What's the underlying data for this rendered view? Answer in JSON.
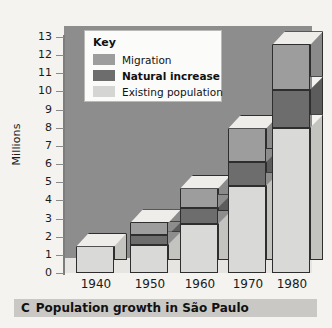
{
  "figure": {
    "caption_letter": "C",
    "caption_text": "Population growth in São Paulo"
  },
  "legend": {
    "title": "Key",
    "items": [
      {
        "label": "Migration",
        "color": "#9d9d9d",
        "bold": false
      },
      {
        "label": "Natural increase",
        "color": "#6d6d6d",
        "bold": true
      },
      {
        "label": "Existing population",
        "color": "#d5d5d3",
        "bold": false
      }
    ]
  },
  "chart_data": {
    "type": "bar",
    "title": "Population growth in São Paulo",
    "xlabel": "",
    "ylabel": "Millions",
    "ylim": [
      0,
      13
    ],
    "yticks": [
      13,
      12,
      11,
      10,
      9,
      8,
      7,
      6,
      5,
      4,
      3,
      2,
      1,
      0
    ],
    "grid": false,
    "stacked": true,
    "legend_position": "inside-top-left",
    "categories": [
      "1940",
      "1950",
      "1960",
      "1970",
      "1980"
    ],
    "series": [
      {
        "name": "Existing population",
        "color": "#d5d5d3",
        "values": [
          1.5,
          1.55,
          2.7,
          4.8,
          8.0
        ]
      },
      {
        "name": "Natural increase",
        "color": "#6d6d6d",
        "values": [
          0,
          0.55,
          0.9,
          1.3,
          2.1
        ]
      },
      {
        "name": "Migration",
        "color": "#9d9d9d",
        "values": [
          0,
          0.7,
          1.1,
          1.9,
          2.5
        ]
      }
    ],
    "totals": [
      1.5,
      2.8,
      4.7,
      8.0,
      12.6
    ]
  },
  "colors": {
    "plot_background": "#8d8d8d",
    "page_background": "#f4f3f0",
    "caption_background": "#c9c8c5",
    "axis": "#1a1a1a"
  }
}
